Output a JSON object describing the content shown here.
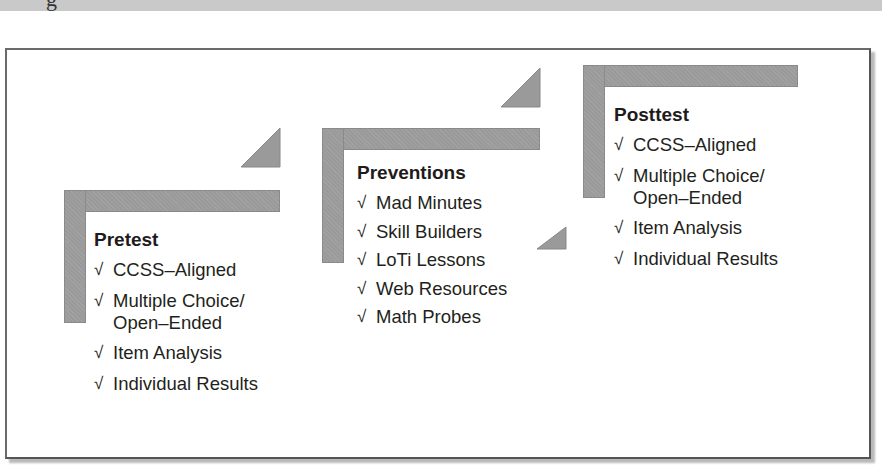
{
  "header": {
    "cut_text": "g"
  },
  "diagram": {
    "bar_color": "#9a9a9a",
    "check_glyph": "√",
    "stages": [
      {
        "title": "Pretest",
        "items": [
          "CCSS–Aligned",
          "Multiple Choice/\nOpen–Ended",
          "Item Analysis",
          "Individual Results"
        ]
      },
      {
        "title": "Preventions",
        "items": [
          "Mad Minutes",
          "Skill Builders",
          "LoTi Lessons",
          "Web Resources",
          "Math Probes"
        ]
      },
      {
        "title": "Posttest",
        "items": [
          "CCSS–Aligned",
          "Multiple Choice/\nOpen–Ended",
          "Item Analysis",
          "Individual Results"
        ]
      }
    ]
  }
}
